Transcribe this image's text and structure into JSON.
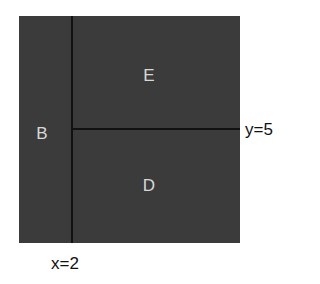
{
  "diagram": {
    "regions": [
      {
        "id": "B",
        "label": "B"
      },
      {
        "id": "E",
        "label": "E"
      },
      {
        "id": "D",
        "label": "D"
      }
    ],
    "splits": {
      "vertical": {
        "label": "x=2"
      },
      "horizontal": {
        "label": "y=5"
      }
    },
    "colors": {
      "fill": "#3b3b3b",
      "split_line": "#111111",
      "region_text": "#d8d8d8"
    }
  }
}
